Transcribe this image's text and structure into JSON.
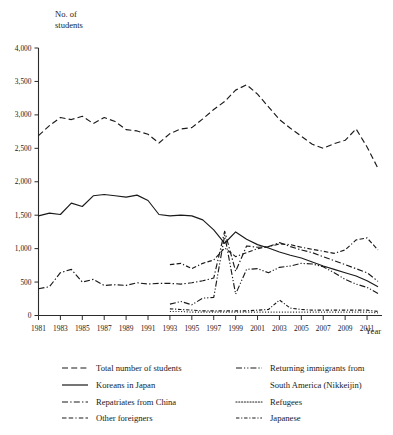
{
  "chart_data": {
    "type": "line",
    "title": "",
    "ylabel": "No. of students",
    "xlabel": "Year",
    "ylim": [
      0,
      4000
    ],
    "xlim": [
      1981,
      2012
    ],
    "grid": false,
    "legend_position": "bottom",
    "y_ticks": [
      "0",
      "500",
      "1,000",
      "1,500",
      "2,000",
      "2,500",
      "3,000",
      "3,500",
      "4,000"
    ],
    "y_tick_values": [
      0,
      500,
      1000,
      1500,
      2000,
      2500,
      3000,
      3500,
      4000
    ],
    "x_ticks": [
      "1981",
      "1983",
      "1985",
      "1987",
      "1989",
      "1991",
      "1993",
      "1995",
      "1997",
      "1999",
      "2001",
      "2003",
      "2005",
      "2007",
      "2009",
      "2011"
    ],
    "x_tick_values": [
      1981,
      1983,
      1985,
      1987,
      1989,
      1991,
      1993,
      1995,
      1997,
      1999,
      2001,
      2003,
      2005,
      2007,
      2009,
      2011
    ],
    "x": [
      1981,
      1982,
      1983,
      1984,
      1985,
      1986,
      1987,
      1988,
      1989,
      1990,
      1991,
      1992,
      1993,
      1994,
      1995,
      1996,
      1997,
      1998,
      1999,
      2000,
      2001,
      2002,
      2003,
      2004,
      2005,
      2006,
      2007,
      2008,
      2009,
      2010,
      2011,
      2012
    ],
    "series": [
      {
        "name": "Total number of students",
        "style": "dashed",
        "values": [
          2690,
          2840,
          2960,
          2930,
          2980,
          2870,
          2960,
          2900,
          2780,
          2760,
          2710,
          2580,
          2720,
          2790,
          2810,
          2940,
          3080,
          3200,
          3370,
          3450,
          3310,
          3120,
          2930,
          2800,
          2680,
          2560,
          2500,
          2570,
          2620,
          2790,
          2520,
          2200
        ]
      },
      {
        "name": "Koreans in Japan",
        "style": "solid",
        "values": [
          1490,
          1530,
          1510,
          1680,
          1630,
          1790,
          1810,
          1790,
          1770,
          1800,
          1720,
          1510,
          1490,
          1500,
          1490,
          1430,
          1280,
          1080,
          1250,
          1140,
          1060,
          1010,
          950,
          900,
          860,
          800,
          740,
          690,
          640,
          590,
          520,
          430
        ]
      },
      {
        "name": "Repatriates from China",
        "style": "dashdot",
        "values": [
          400,
          430,
          640,
          690,
          500,
          540,
          450,
          460,
          450,
          490,
          470,
          480,
          480,
          470,
          490,
          520,
          560,
          1260,
          660,
          1040,
          1020,
          1030,
          1090,
          1030,
          980,
          940,
          880,
          820,
          760,
          700,
          640,
          510
        ]
      },
      {
        "name": "Other foreigners",
        "style": "dash-dash-dot",
        "values": [
          null,
          null,
          null,
          null,
          null,
          null,
          null,
          null,
          null,
          null,
          null,
          null,
          760,
          780,
          700,
          780,
          830,
          1010,
          880,
          940,
          1000,
          1030,
          1070,
          1060,
          1020,
          990,
          960,
          930,
          980,
          1130,
          1160,
          980
        ]
      },
      {
        "name": "Returning immigrants from South America (Nikkeijin)",
        "style": "dash-dot-dot",
        "values": [
          null,
          null,
          null,
          null,
          null,
          null,
          null,
          null,
          null,
          null,
          null,
          null,
          170,
          210,
          160,
          260,
          270,
          1200,
          320,
          690,
          700,
          640,
          720,
          740,
          780,
          770,
          730,
          640,
          540,
          470,
          420,
          330
        ]
      },
      {
        "name": "Refugees",
        "style": "dotted",
        "values": [
          null,
          null,
          null,
          null,
          null,
          null,
          null,
          null,
          null,
          null,
          null,
          null,
          60,
          60,
          50,
          50,
          50,
          50,
          50,
          50,
          50,
          50,
          50,
          50,
          50,
          50,
          50,
          50,
          50,
          50,
          50,
          40
        ]
      },
      {
        "name": "Japanese",
        "style": "dashdot-fine",
        "values": [
          null,
          null,
          null,
          null,
          null,
          null,
          null,
          null,
          null,
          null,
          null,
          null,
          100,
          90,
          80,
          70,
          70,
          70,
          70,
          70,
          80,
          90,
          230,
          110,
          90,
          80,
          80,
          80,
          80,
          80,
          80,
          60
        ]
      }
    ]
  },
  "legend": {
    "items": [
      {
        "label": "Total number of students",
        "style": "dashed"
      },
      {
        "label": "Koreans in Japan",
        "style": "solid"
      },
      {
        "label": "Repatriates from China",
        "style": "dashdot"
      },
      {
        "label": "Other foreigners",
        "style": "dash-dash-dot"
      },
      {
        "label": "Returning immigrants from",
        "label2": "South America (Nikkeijin)",
        "style": "dash-dot-dot"
      },
      {
        "label": "Refugees",
        "style": "dotted"
      },
      {
        "label": "Japanese",
        "style": "dashdot-fine"
      }
    ]
  },
  "colors": {
    "ink": "#1a1a1a",
    "axis": "#2b2b2b",
    "background": "#ffffff"
  }
}
